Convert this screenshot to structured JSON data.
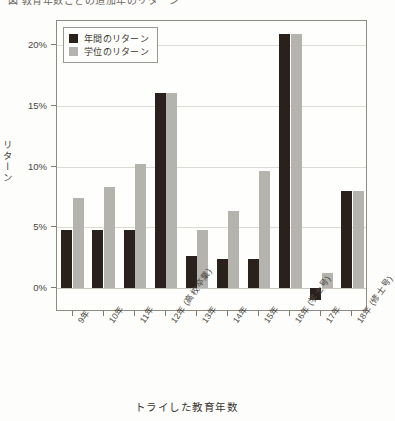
{
  "figure": {
    "top_cropped_text": "図 教育年数ごとの追加年のリターン"
  },
  "legend": {
    "position": "top-left inside plot",
    "entries": [
      {
        "label": "年間のリターン",
        "color": "#2b211c"
      },
      {
        "label": "学位のリターン",
        "color": "#b4b3ae"
      }
    ]
  },
  "axes": {
    "ylabel": "リターン",
    "xlabel": "トライした教育年数",
    "yticks": [
      "0%",
      "5%",
      "10%",
      "15%",
      "20%"
    ]
  },
  "chart_data": {
    "type": "bar",
    "title": "",
    "xlabel": "トライした教育年数",
    "ylabel": "リターン",
    "ylim": [
      -2,
      22
    ],
    "yticks": [
      0,
      5,
      10,
      15,
      20
    ],
    "ytick_labels": [
      "0%",
      "5%",
      "10%",
      "15%",
      "20%"
    ],
    "grid": true,
    "legend_position": "upper left",
    "categories": [
      "9年",
      "10年",
      "11年",
      "12年 (高校卒業)",
      "13年",
      "14年",
      "15年",
      "16年 (学士号)",
      "17年",
      "18年 (修士号)"
    ],
    "series": [
      {
        "name": "年間のリターン",
        "color": "#2b211c",
        "values": [
          4.8,
          4.8,
          4.8,
          16.1,
          2.6,
          2.4,
          2.4,
          20.9,
          -1.0,
          8.0
        ]
      },
      {
        "name": "学位のリターン",
        "color": "#b4b3ae",
        "values": [
          7.4,
          8.3,
          10.2,
          16.1,
          4.8,
          6.3,
          9.6,
          20.9,
          1.2,
          8.0
        ]
      }
    ]
  }
}
